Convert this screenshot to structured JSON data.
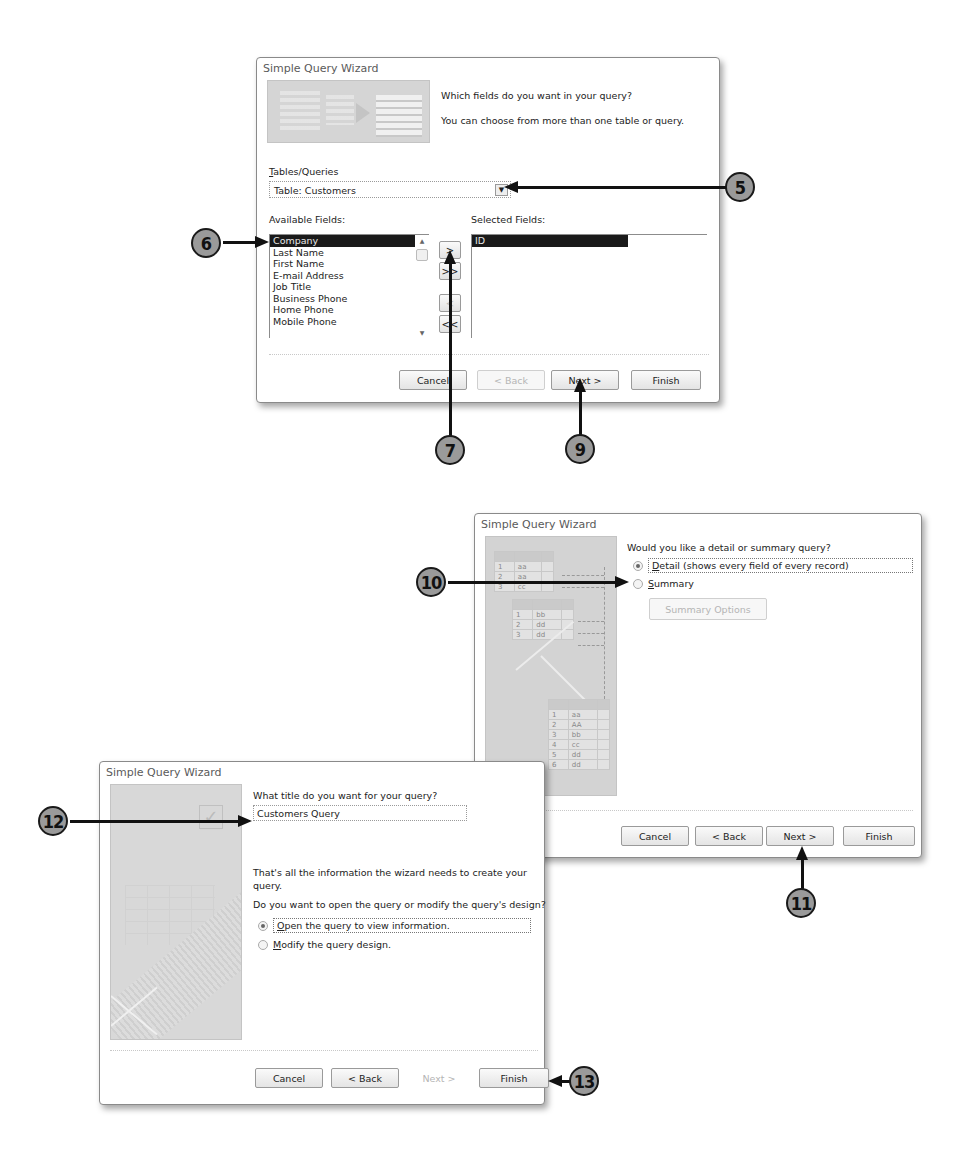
{
  "dialog1": {
    "title": "Simple Query Wizard",
    "prompt": "Which fields do you want in your query?",
    "subprompt": "You can choose from more than one table or query.",
    "tables_label": "Tables/Queries",
    "tables_label_accel": "T",
    "tables_value": "Table: Customers",
    "available_label": "Available Fields:",
    "selected_label": "Selected Fields:",
    "available_fields": [
      "Company",
      "Last Name",
      "First Name",
      "E-mail Address",
      "Job Title",
      "Business Phone",
      "Home Phone",
      "Mobile Phone"
    ],
    "available_selected_index": 0,
    "selected_fields": [
      "ID"
    ],
    "move_buttons": [
      ">",
      ">>",
      "<",
      "<<"
    ],
    "buttons": {
      "cancel": "Cancel",
      "back": "< Back",
      "next": "Next >",
      "finish": "Finish"
    }
  },
  "dialog2": {
    "title": "Simple Query Wizard",
    "prompt": "Would you like a detail or summary query?",
    "options": [
      {
        "label": "Detail (shows every field of every record)",
        "checked": true
      },
      {
        "label": "Summary",
        "checked": false
      }
    ],
    "summary_options_button": "Summary Options",
    "graphic_table1": [
      [
        "1",
        "aa"
      ],
      [
        "2",
        "aa"
      ],
      [
        "3",
        "cc"
      ]
    ],
    "graphic_table2": [
      [
        "1",
        "bb"
      ],
      [
        "2",
        "dd"
      ],
      [
        "3",
        "dd"
      ]
    ],
    "graphic_table3": [
      [
        "1",
        "aa"
      ],
      [
        "2",
        "AA"
      ],
      [
        "3",
        "bb"
      ],
      [
        "4",
        "cc"
      ],
      [
        "5",
        "dd"
      ],
      [
        "6",
        "dd"
      ]
    ],
    "buttons": {
      "cancel": "Cancel",
      "back": "< Back",
      "next": "Next >",
      "finish": "Finish"
    }
  },
  "dialog3": {
    "title": "Simple Query Wizard",
    "prompt": "What title do you want for your query?",
    "title_value": "Customers Query",
    "info": "That's all the information the wizard needs to create your query.",
    "question": "Do you want to open the query or modify the query's design?",
    "options": [
      {
        "label": "Open the query to view information.",
        "checked": true
      },
      {
        "label": "Modify the query design.",
        "checked": false
      }
    ],
    "buttons": {
      "cancel": "Cancel",
      "back": "< Back",
      "next": "Next >",
      "finish": "Finish"
    }
  },
  "callouts": [
    "5",
    "6",
    "7",
    "9",
    "10",
    "11",
    "12",
    "13"
  ]
}
